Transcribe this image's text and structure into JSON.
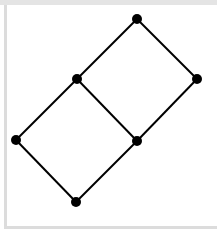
{
  "diagram": {
    "type": "hasse-diagram",
    "nodes": [
      {
        "id": "top",
        "x": 137,
        "y": 19
      },
      {
        "id": "upper-left",
        "x": 77,
        "y": 79
      },
      {
        "id": "right",
        "x": 197,
        "y": 79
      },
      {
        "id": "left",
        "x": 16,
        "y": 140
      },
      {
        "id": "middle-right",
        "x": 137,
        "y": 141
      },
      {
        "id": "bottom",
        "x": 76,
        "y": 202
      }
    ],
    "edges": [
      [
        "top",
        "upper-left"
      ],
      [
        "top",
        "right"
      ],
      [
        "upper-left",
        "left"
      ],
      [
        "upper-left",
        "middle-right"
      ],
      [
        "right",
        "middle-right"
      ],
      [
        "left",
        "bottom"
      ],
      [
        "middle-right",
        "bottom"
      ]
    ],
    "node_radius": 5,
    "line_width": 2,
    "colors": {
      "node": "#000000",
      "edge": "#000000",
      "background": "#ffffff",
      "frame": "#dcdcdc"
    }
  }
}
